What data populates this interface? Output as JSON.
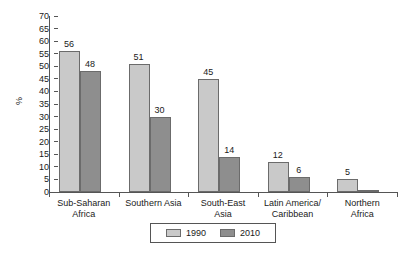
{
  "chart_data": {
    "type": "bar",
    "title": "",
    "subtitle": "",
    "xlabel": "",
    "ylabel": "%",
    "ylim": [
      0,
      70
    ],
    "ytick_step": 5,
    "yticks": [
      70,
      65,
      60,
      55,
      50,
      45,
      40,
      35,
      30,
      25,
      20,
      15,
      10,
      5,
      0
    ],
    "grid": false,
    "legend_position": "bottom-center",
    "categories": [
      "Sub-Saharan Africa",
      "Southern Asia",
      "South-East Asia",
      "Latin America/ Caribbean",
      "Northern Africa"
    ],
    "category_lines": [
      [
        "Sub-Saharan",
        "Africa"
      ],
      [
        "Southern Asia",
        ""
      ],
      [
        "South-East",
        "Asia"
      ],
      [
        "Latin America/",
        "Caribbean"
      ],
      [
        "Northern",
        "Africa"
      ]
    ],
    "series": [
      {
        "name": "1990",
        "color": "#c9c9c9",
        "values": [
          56,
          51,
          45,
          12,
          5
        ],
        "labels": [
          "56",
          "51",
          "45",
          "12",
          "5"
        ]
      },
      {
        "name": "2010",
        "color": "#8e8e8e",
        "values": [
          48,
          30,
          14,
          6,
          1
        ],
        "labels": [
          "48",
          "30",
          "14",
          "6",
          ""
        ]
      }
    ]
  },
  "legend": {
    "items": [
      {
        "label": "1990",
        "color": "#c9c9c9"
      },
      {
        "label": "2010",
        "color": "#8e8e8e"
      }
    ]
  },
  "axis": {
    "y_title": "%"
  }
}
